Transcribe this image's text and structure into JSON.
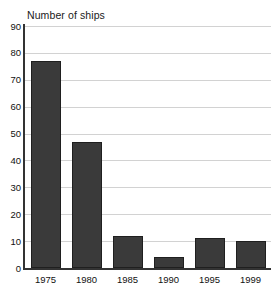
{
  "chart_data": {
    "type": "bar",
    "title": "Number of ships",
    "xlabel": "",
    "ylabel": "",
    "categories": [
      "1975",
      "1980",
      "1985",
      "1990",
      "1995",
      "1999"
    ],
    "values": [
      77,
      47,
      12,
      4,
      11,
      10
    ],
    "ylim": [
      0,
      90
    ],
    "ytick_step": 10,
    "yticks": [
      "0",
      "10",
      "20",
      "30",
      "40",
      "50",
      "60",
      "70",
      "80",
      "90"
    ],
    "grid": true,
    "legend": false,
    "legend_position": "none",
    "colors": {
      "bar_fill": "#3a3a3a",
      "bar_border": "#1f1f1f",
      "gridline": "#d2d2d2",
      "axis": "#333333",
      "text": "#111111",
      "background": "#ffffff"
    }
  }
}
